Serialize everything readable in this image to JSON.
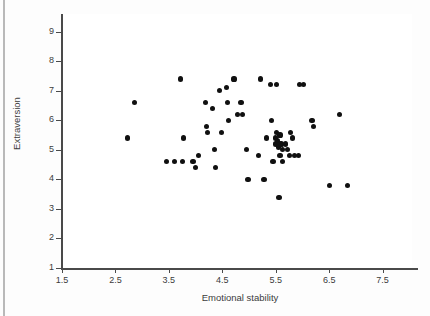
{
  "chart_data": {
    "type": "scatter",
    "title": "",
    "xlabel": "Emotional stability",
    "ylabel": "Extraversion",
    "xlim": [
      1.5,
      8.05
    ],
    "ylim": [
      1,
      9.6
    ],
    "xticks": [
      "1.5",
      "2.5",
      "3.5",
      "4.5",
      "5.5",
      "6.5",
      "7.5"
    ],
    "xtick_values": [
      1.5,
      2.5,
      3.5,
      4.5,
      5.5,
      6.5,
      7.5
    ],
    "yticks": [
      "1",
      "2",
      "3",
      "4",
      "5",
      "6",
      "7",
      "8",
      "9"
    ],
    "ytick_values": [
      1,
      2,
      3,
      4,
      5,
      6,
      7,
      8,
      9
    ],
    "grid": false,
    "legend": false,
    "marker_color": "#101010",
    "axis_color": "#4a4a4a",
    "background": "#ffffff",
    "points": [
      [
        2.85,
        6.6
      ],
      [
        2.72,
        5.4
      ],
      [
        3.45,
        4.6
      ],
      [
        3.6,
        4.6
      ],
      [
        3.75,
        4.6
      ],
      [
        3.72,
        7.4
      ],
      [
        3.78,
        5.4
      ],
      [
        3.95,
        4.6
      ],
      [
        4.0,
        4.4
      ],
      [
        4.05,
        4.8
      ],
      [
        4.18,
        6.6
      ],
      [
        4.2,
        5.8
      ],
      [
        4.22,
        5.6
      ],
      [
        4.32,
        6.4
      ],
      [
        4.35,
        5.0
      ],
      [
        4.38,
        4.4
      ],
      [
        4.45,
        7.0
      ],
      [
        4.48,
        5.6
      ],
      [
        4.58,
        7.1
      ],
      [
        4.6,
        6.6
      ],
      [
        4.62,
        6.0
      ],
      [
        4.72,
        7.4
      ],
      [
        4.78,
        6.2
      ],
      [
        4.85,
        6.6
      ],
      [
        4.88,
        6.2
      ],
      [
        4.95,
        5.0
      ],
      [
        4.98,
        4.0
      ],
      [
        5.18,
        4.8
      ],
      [
        5.22,
        7.4
      ],
      [
        5.28,
        4.0
      ],
      [
        5.32,
        5.4
      ],
      [
        5.4,
        7.2
      ],
      [
        5.42,
        6.0
      ],
      [
        5.45,
        4.6
      ],
      [
        5.5,
        5.4
      ],
      [
        5.5,
        5.2
      ],
      [
        5.52,
        5.6
      ],
      [
        5.52,
        7.2
      ],
      [
        5.54,
        5.3
      ],
      [
        5.55,
        5.1
      ],
      [
        5.56,
        3.4
      ],
      [
        5.58,
        5.5
      ],
      [
        5.58,
        4.8
      ],
      [
        5.6,
        5.2
      ],
      [
        5.62,
        5.0
      ],
      [
        5.62,
        4.6
      ],
      [
        5.68,
        5.2
      ],
      [
        5.72,
        5.0
      ],
      [
        5.75,
        4.8
      ],
      [
        5.78,
        5.6
      ],
      [
        5.82,
        5.4
      ],
      [
        5.85,
        4.8
      ],
      [
        5.92,
        4.8
      ],
      [
        5.95,
        7.2
      ],
      [
        6.02,
        7.2
      ],
      [
        6.18,
        6.0
      ],
      [
        6.2,
        5.8
      ],
      [
        6.5,
        3.8
      ],
      [
        6.7,
        6.2
      ],
      [
        6.85,
        3.8
      ]
    ]
  }
}
